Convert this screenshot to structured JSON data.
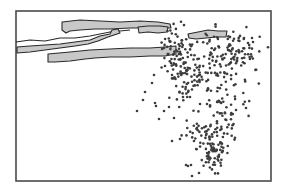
{
  "figure": {
    "width": 282,
    "height": 192,
    "frame": {
      "x": 16,
      "y": 11,
      "w": 255,
      "h": 170,
      "stroke": "#4a4a4a"
    },
    "colors": {
      "background": "#ffffff",
      "slab_fill": "#c8c8c8",
      "slab_stroke": "#2a2a2a",
      "dot": "#3c3c3c"
    }
  },
  "slabs": [
    {
      "name": "upper-left-thin-layer",
      "top": "16,42 30,40 45,41 60,38 75,38 90,36 110,32 130,30",
      "thickness": 0,
      "fill": false
    },
    {
      "name": "upper-slab-a",
      "top": "62,22 80,20 100,21 120,22 140,21 158,22 170,24 171,28 150,28 130,28 110,29 95,29 80,30 70,31 66,33 62,30",
      "thickness": 0,
      "fill": true
    },
    {
      "name": "left-sloping-slab",
      "top": "17,47 30,46 45,45 60,44 75,42 90,40 100,36 110,34 112,30 118,29 120,33 108,37 98,41 88,44 75,46 60,48 45,50 30,52 17,53",
      "thickness": 0,
      "fill": true
    },
    {
      "name": "lower-long-slab",
      "top": "48,54 70,52 90,50 110,49 130,48 150,48 165,47 176,46 176,54 165,56 150,56 130,57 110,57 95,58 85,59 70,61 55,62 48,62",
      "thickness": 0,
      "fill": true
    },
    {
      "name": "small-right-slab-a",
      "top": "138,27 148,26 160,26 168,27 167,32 158,33 148,32 139,33",
      "thickness": 0,
      "fill": true
    },
    {
      "name": "small-right-slab-b",
      "top": "188,34 198,32 208,30 218,31 227,31 226,37 216,37 206,38 196,39 189,38",
      "thickness": 0,
      "fill": true
    }
  ],
  "scatter": {
    "dot_radius": 1.3,
    "clusters": [
      {
        "cx": 176,
        "cy": 50,
        "sx": 7,
        "sy": 14,
        "n": 60
      },
      {
        "cx": 196,
        "cy": 62,
        "sx": 14,
        "sy": 14,
        "n": 55
      },
      {
        "cx": 232,
        "cy": 52,
        "sx": 16,
        "sy": 12,
        "n": 90
      },
      {
        "cx": 220,
        "cy": 88,
        "sx": 14,
        "sy": 16,
        "n": 60
      },
      {
        "cx": 185,
        "cy": 80,
        "sx": 9,
        "sy": 14,
        "n": 35
      },
      {
        "cx": 213,
        "cy": 150,
        "sx": 8,
        "sy": 12,
        "n": 80
      },
      {
        "cx": 198,
        "cy": 128,
        "sx": 12,
        "sy": 5,
        "n": 25
      },
      {
        "cx": 226,
        "cy": 118,
        "sx": 6,
        "sy": 14,
        "n": 30
      }
    ],
    "points": [
      [
        159,
        119
      ],
      [
        174,
        118
      ],
      [
        156,
        106
      ],
      [
        155,
        103
      ],
      [
        145,
        92
      ],
      [
        137,
        111
      ],
      [
        152,
        83
      ],
      [
        165,
        66
      ],
      [
        172,
        75
      ],
      [
        192,
        176
      ],
      [
        186,
        165
      ],
      [
        188,
        166
      ],
      [
        199,
        173
      ],
      [
        191,
        165
      ],
      [
        172,
        141
      ],
      [
        180,
        139
      ],
      [
        194,
        141
      ],
      [
        246,
        108
      ],
      [
        236,
        110
      ],
      [
        253,
        42
      ],
      [
        252,
        38
      ],
      [
        244,
        38
      ],
      [
        221,
        103
      ],
      [
        183,
        97
      ],
      [
        190,
        97
      ],
      [
        207,
        104
      ],
      [
        200,
        104
      ],
      [
        154,
        75
      ],
      [
        143,
        100
      ],
      [
        164,
        111
      ],
      [
        169,
        107
      ]
    ]
  }
}
